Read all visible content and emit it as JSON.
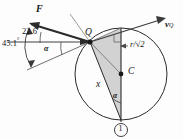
{
  "figure": {
    "name": "rolling-disc-velocity-diagram",
    "type": "geometry-vector-diagram",
    "background_color": "#fdfdfd",
    "stroke_color": "#2b2b2b",
    "shade_color": "#b9b9b9"
  },
  "labels": {
    "force": "F",
    "velocity": "v",
    "velocity_sub": "Q",
    "angle_upper": "22.6",
    "angle_lower": "45.1",
    "degree": "°",
    "alpha": "α",
    "alpha_inner": "α",
    "point_q": "Q",
    "point_c": "C",
    "length_x": "x",
    "radius_label": "r/√2",
    "contact_marker": "1"
  },
  "geometry": {
    "circle_center_x": 121,
    "circle_center_y": 74,
    "circle_radius": 46,
    "point_q_x": 90,
    "point_q_y": 42,
    "contact_point_x": 121,
    "contact_point_y": 120,
    "top_point_x": 121,
    "top_point_y": 28
  }
}
